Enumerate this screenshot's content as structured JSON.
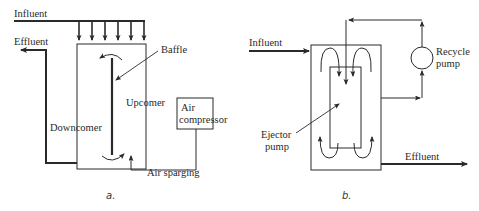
{
  "figure": {
    "panels": [
      {
        "id": "a",
        "caption": "a.",
        "labels": {
          "influent": "Influent",
          "effluent": "Effluent",
          "baffle": "Baffle",
          "upcomer": "Upcomer",
          "downcomer": "Downcomer",
          "air_compressor_line1": "Air",
          "air_compressor_line2": "compressor",
          "air_sparging": "Air sparging"
        }
      },
      {
        "id": "b",
        "caption": "b.",
        "labels": {
          "influent": "Influent",
          "effluent": "Effluent",
          "recycle_pump_line1": "Recycle",
          "recycle_pump_line2": "pump",
          "ejector_pump_line1": "Ejector",
          "ejector_pump_line2": "pump"
        }
      }
    ],
    "colors": {
      "line": "#2a2a2a",
      "background": "#ffffff"
    }
  }
}
